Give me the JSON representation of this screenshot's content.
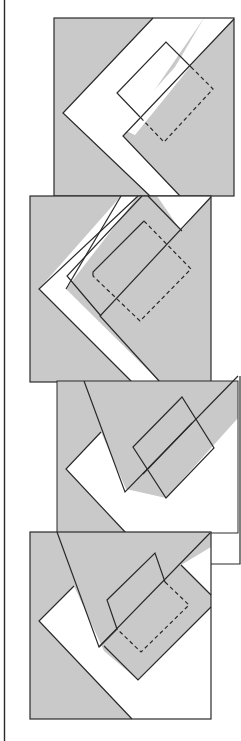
{
  "figure": {
    "colors": {
      "shade": "#c9c9c9",
      "background": "#ffffff",
      "line": "#2a2a2a"
    },
    "panels": [
      {
        "id": 1,
        "label": ""
      },
      {
        "id": 2,
        "label": ""
      },
      {
        "id": 3,
        "label": ""
      },
      {
        "id": 4,
        "label": ""
      }
    ]
  }
}
